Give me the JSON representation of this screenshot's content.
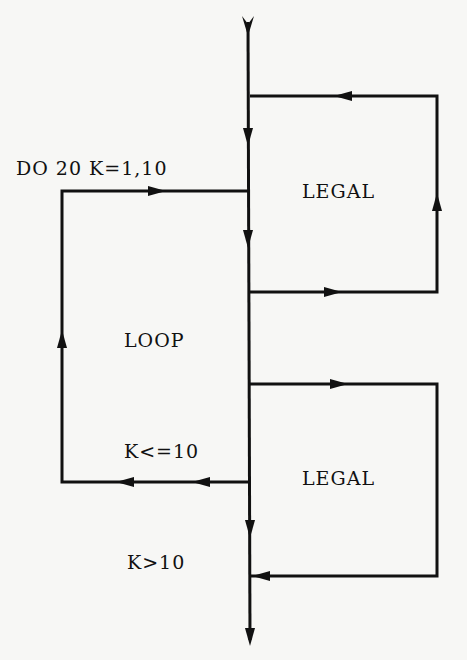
{
  "diagram": {
    "labels": {
      "do_statement": "DO 20 K=1,10",
      "legal_top": "LEGAL",
      "loop": "LOOP",
      "condition_continue": "K<=10",
      "legal_bottom": "LEGAL",
      "condition_exit": "K>10"
    },
    "colors": {
      "line": "#111111",
      "background": "#f7f7f5"
    }
  }
}
